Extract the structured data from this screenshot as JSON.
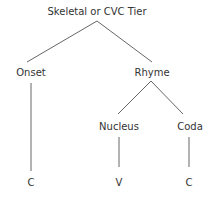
{
  "diagram": {
    "type": "tree",
    "line_color": "#555555",
    "text_color": "#333333",
    "root": {
      "label": "Skeletal or CVC Tier"
    },
    "nodes": {
      "onset": {
        "label": "Onset"
      },
      "rhyme": {
        "label": "Rhyme"
      },
      "nucleus": {
        "label": "Nucleus"
      },
      "coda": {
        "label": "Coda"
      }
    },
    "leaves": {
      "onset_leaf": {
        "label": "C"
      },
      "nucleus_leaf": {
        "label": "V"
      },
      "coda_leaf": {
        "label": "C"
      }
    },
    "edges": [
      [
        "Skeletal or CVC Tier",
        "Onset"
      ],
      [
        "Skeletal or CVC Tier",
        "Rhyme"
      ],
      [
        "Rhyme",
        "Nucleus"
      ],
      [
        "Rhyme",
        "Coda"
      ],
      [
        "Onset",
        "C"
      ],
      [
        "Nucleus",
        "V"
      ],
      [
        "Coda",
        "C"
      ]
    ]
  }
}
